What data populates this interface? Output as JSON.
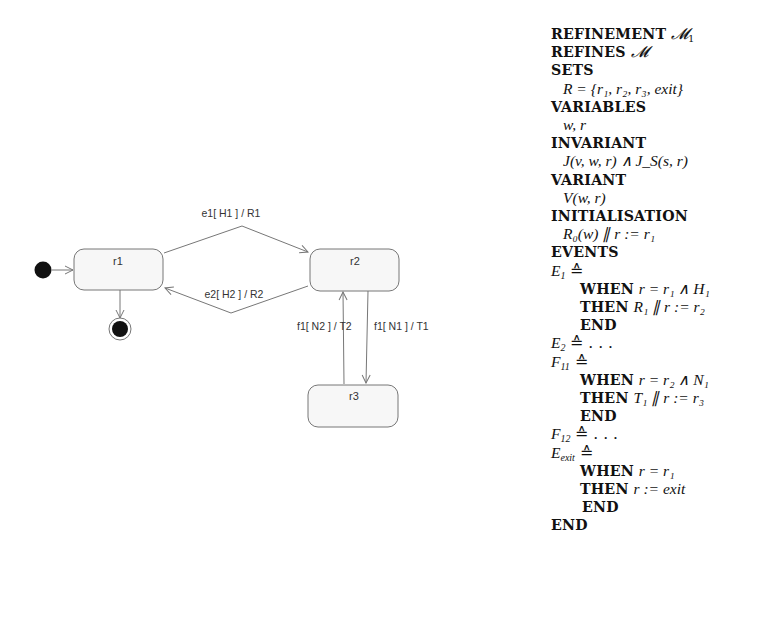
{
  "diagram": {
    "states": [
      {
        "id": "r1",
        "label": "r1"
      },
      {
        "id": "r2",
        "label": "r2"
      },
      {
        "id": "r3",
        "label": "r3"
      }
    ],
    "transitions": [
      {
        "from": "r1",
        "to": "r2",
        "label": "e1[ H1 ] / R1"
      },
      {
        "from": "r2",
        "to": "r1",
        "label": "e2[ H2 ] / R2"
      },
      {
        "from": "r3",
        "to": "r2",
        "label": "f1[ N2 ] / T2"
      },
      {
        "from": "r2",
        "to": "r3",
        "label": "f1[ N1 ] / T1"
      },
      {
        "from": "initial",
        "to": "r1",
        "label": ""
      },
      {
        "from": "r1",
        "to": "final",
        "label": ""
      }
    ],
    "colors": {
      "stroke": "#777777",
      "fill": "#f7f7f7",
      "node": "#111111"
    }
  },
  "spec": {
    "refinement_kw": "REFINEMENT",
    "refinement_name": "𝓜",
    "refinement_sub": "1",
    "refines_kw": "REFINES",
    "refines_name": "𝓜",
    "sets_kw": "SETS",
    "sets_value": "R = {r₁, r₂, r₃, exit}",
    "variables_kw": "VARIABLES",
    "variables_value": "w, r",
    "invariant_kw": "INVARIANT",
    "invariant_value": "J(v, w, r) ∧ J_S(s, r)",
    "variant_kw": "VARIANT",
    "variant_value": "V(w, r)",
    "initialisation_kw": "INITIALISATION",
    "initialisation_value": "R₀(w) ∥ r := r₁",
    "events_kw": "EVENTS",
    "events": [
      {
        "name": "E",
        "sub": "1",
        "def": "≙",
        "when_kw": "WHEN",
        "when": "r = r₁ ∧ H₁",
        "then_kw": "THEN",
        "then": "R₁ ∥ r := r₂",
        "end_kw": "END"
      },
      {
        "name": "E",
        "sub": "2",
        "def": "≙ . . ."
      },
      {
        "name": "F",
        "sub": "11",
        "def": "≙",
        "when_kw": "WHEN",
        "when": "r = r₂ ∧ N₁",
        "then_kw": "THEN",
        "then": "T₁ ∥ r := r₃",
        "end_kw": "END"
      },
      {
        "name": "F",
        "sub": "12",
        "def": "≙ . . ."
      },
      {
        "name": "E",
        "sub": "exit",
        "def": "≙",
        "when_kw": "WHEN",
        "when": "r = r₁",
        "then_kw": "THEN",
        "then": "r := exit",
        "end_kw": "END"
      }
    ],
    "end_kw": "END"
  }
}
